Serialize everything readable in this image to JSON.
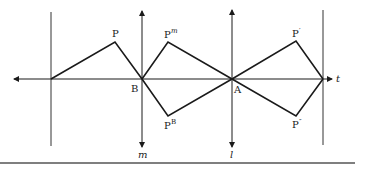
{
  "diagram": {
    "colors": {
      "line": "#1a1a1a",
      "background": "#ffffff",
      "rule": "#555555"
    },
    "axis_t": {
      "label": "t"
    },
    "line_m": {
      "label": "m"
    },
    "line_l": {
      "label": "l"
    },
    "points": {
      "P": {
        "label": "P",
        "sup": ""
      },
      "Pm": {
        "label": "P",
        "sup": "m"
      },
      "PB": {
        "label": "P",
        "sup": "B"
      },
      "Pprime": {
        "label": "P",
        "sup": "′"
      },
      "Pdprime": {
        "label": "P",
        "sup": "″"
      },
      "B": {
        "label": "B"
      },
      "A": {
        "label": "A"
      }
    }
  }
}
